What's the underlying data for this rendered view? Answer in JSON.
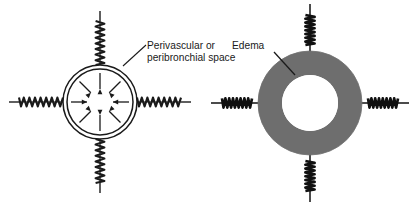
{
  "figure": {
    "title": "",
    "background_color": "#ffffff",
    "width": 419,
    "height": 203
  },
  "panels": [
    {
      "id": "normal",
      "label": {
        "line1": "Perivascular or",
        "line2": "peribronchial space",
        "text_color": "#1a1a1a"
      },
      "vessel": {
        "type": "double-circle-outline",
        "center_x": 100,
        "center_y": 102,
        "outer_radius": 37,
        "inner_radius": 33,
        "stroke_color": "#1a1a1a",
        "fill_color": "#ffffff"
      },
      "arrows": {
        "count": 8,
        "direction": "inward",
        "angles_deg": [
          0,
          45,
          90,
          135,
          180,
          225,
          270,
          315
        ],
        "color": "#1a1a1a"
      },
      "springs": {
        "count": 4,
        "state": "relaxed",
        "positions": [
          "top",
          "right",
          "bottom",
          "left"
        ],
        "coil_color": "#1a1a1a"
      }
    },
    {
      "id": "edema",
      "label": {
        "line1": "Edema",
        "line2": "",
        "text_color": "#1a1a1a"
      },
      "vessel": {
        "type": "filled-annulus",
        "center_x": 310,
        "center_y": 103,
        "outer_radius": 52,
        "inner_radius": 28,
        "stroke_color": "#6e6e6e",
        "fill_color": "#6e6e6e"
      },
      "arrows": {
        "count": 0,
        "direction": "none",
        "angles_deg": [],
        "color": "#1a1a1a"
      },
      "springs": {
        "count": 4,
        "state": "compressed",
        "positions": [
          "top",
          "right",
          "bottom",
          "left"
        ],
        "coil_color": "#111111"
      }
    }
  ],
  "colors": {
    "edema_gray": "#6e6e6e",
    "ink": "#1a1a1a",
    "paper": "#ffffff"
  }
}
